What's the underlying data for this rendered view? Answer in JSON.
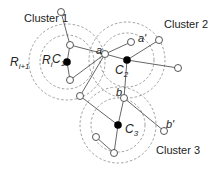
{
  "diagram": {
    "labels": {
      "cluster1": "Cluster 1",
      "cluster2": "Cluster 2",
      "cluster3": "Cluster 3",
      "r_i": "R",
      "r_i_sub": "i",
      "r_i1": "R",
      "r_i1_sub": "i+1",
      "c1": "C",
      "c1_sub": "1",
      "c2": "C",
      "c2_sub": "2",
      "c3": "C",
      "c3_sub": "3",
      "a": "a",
      "a_prime": "a'",
      "b": "b",
      "b_prime": "b'"
    },
    "colors": {
      "line": "#555555",
      "dashed": "#888888",
      "filled_node": "#000000",
      "open_node": "#ffffff"
    }
  }
}
